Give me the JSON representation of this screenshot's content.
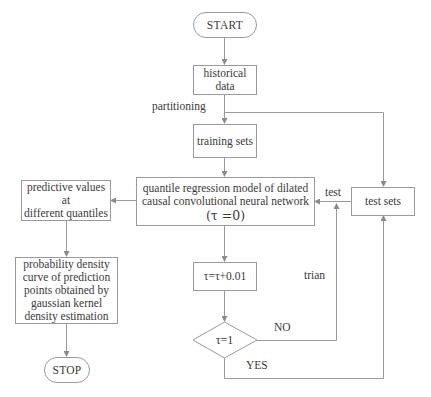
{
  "diagram": {
    "type": "flowchart",
    "nodes": {
      "start": {
        "label": "START",
        "shape": "terminal"
      },
      "historical_data": {
        "label": "historical data",
        "line1": "historical",
        "line2": "data",
        "shape": "process"
      },
      "training_sets": {
        "label": "training sets",
        "shape": "process"
      },
      "quantile_model": {
        "line1": "quantile regression model of dilated",
        "line2": "causal convolutional neural network",
        "line3": "(τ =0)",
        "shape": "process"
      },
      "test_sets": {
        "label": "test sets",
        "shape": "process"
      },
      "predictive_values": {
        "line1": "predictive values at",
        "line2": "different quantiles",
        "shape": "process"
      },
      "probability_density": {
        "line1": "probability density",
        "line2": "curve of prediction",
        "line3": "points obtained by",
        "line4": "gaussian kernel",
        "line5": "density estimation",
        "shape": "process"
      },
      "tau_increment": {
        "label": "τ=τ+0.01",
        "shape": "process"
      },
      "tau_decision": {
        "label": "τ=1",
        "shape": "decision"
      },
      "stop": {
        "label": "STOP",
        "shape": "terminal"
      }
    },
    "edge_labels": {
      "partitioning": "partitioning",
      "test": "test",
      "trian": "trian",
      "no": "NO",
      "yes": "YES"
    },
    "edges": [
      {
        "from": "start",
        "to": "historical_data"
      },
      {
        "from": "historical_data",
        "to": "training_sets",
        "label": "partitioning"
      },
      {
        "from": "historical_data",
        "to": "test_sets",
        "label": "partitioning"
      },
      {
        "from": "training_sets",
        "to": "quantile_model"
      },
      {
        "from": "test_sets",
        "to": "quantile_model",
        "label": "test"
      },
      {
        "from": "quantile_model",
        "to": "predictive_values"
      },
      {
        "from": "quantile_model",
        "to": "tau_increment"
      },
      {
        "from": "tau_increment",
        "to": "tau_decision"
      },
      {
        "from": "tau_decision",
        "to": "quantile_model",
        "label": "NO"
      },
      {
        "from": "tau_decision",
        "to": "test_sets",
        "label": "YES"
      },
      {
        "from": "predictive_values",
        "to": "probability_density"
      },
      {
        "from": "probability_density",
        "to": "stop"
      }
    ],
    "colors": {
      "line": "#9a9a9a",
      "text": "#3a3a3a",
      "background": "#ffffff"
    }
  }
}
